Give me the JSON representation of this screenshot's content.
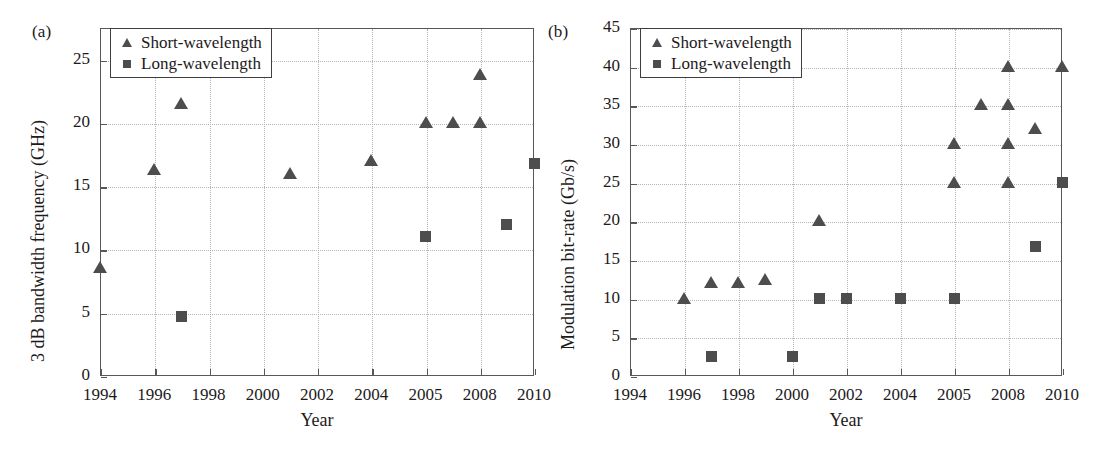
{
  "figure": {
    "panels": [
      {
        "tag": "(a)",
        "ylabel": "3 dB bandwidth frequency (GHz)",
        "xlabel": "Year",
        "yticks": [
          "0",
          "5",
          "10",
          "15",
          "20",
          "25"
        ],
        "xticks": [
          "1994",
          "1996",
          "1998",
          "2000",
          "2002",
          "2004",
          "2005",
          "2008",
          "2010"
        ],
        "legend": [
          {
            "label": "Short-wavelength",
            "marker": "triangle-marker"
          },
          {
            "label": "Long-wavelength",
            "marker": "square-marker"
          }
        ]
      },
      {
        "tag": "(b)",
        "ylabel": "Modulation bit-rate (Gb/s)",
        "xlabel": "Year",
        "yticks": [
          "0",
          "5",
          "10",
          "15",
          "20",
          "25",
          "30",
          "35",
          "40",
          "45"
        ],
        "xticks": [
          "1994",
          "1996",
          "1998",
          "2000",
          "2002",
          "2004",
          "2005",
          "2008",
          "2010"
        ],
        "legend": [
          {
            "label": "Short-wavelength",
            "marker": "triangle-marker"
          },
          {
            "label": "Long-wavelength",
            "marker": "square-marker"
          }
        ]
      }
    ],
    "marker_color": "#4d4d4d",
    "axis_color": "#57585a",
    "grid_color": "#b3b3b3"
  },
  "chart_data": [
    {
      "type": "scatter",
      "panel": "(a)",
      "title": "3 dB bandwidth frequency vs Year",
      "xlabel": "Year",
      "ylabel": "3 dB bandwidth frequency (GHz)",
      "xlim": [
        1994,
        2010
      ],
      "ylim": [
        0,
        27.5
      ],
      "yticks": [
        0,
        5,
        10,
        15,
        20,
        25
      ],
      "xticks": [
        1994,
        1996,
        1998,
        2000,
        2002,
        2004,
        2005,
        2008,
        2010
      ],
      "x_axis_type": "categorical-ticks",
      "grid": true,
      "legend_position": "top-left",
      "series": [
        {
          "name": "Short-wavelength",
          "marker": "triangle",
          "points": [
            {
              "x": 1994,
              "y": 8.5
            },
            {
              "x": 1996,
              "y": 16.3
            },
            {
              "x": 1997,
              "y": 21.5
            },
            {
              "x": 2001,
              "y": 16.0
            },
            {
              "x": 2004,
              "y": 17.0
            },
            {
              "x": 2005,
              "y": 20.0
            },
            {
              "x": 2006.5,
              "y": 20.0
            },
            {
              "x": 2008,
              "y": 20.0
            },
            {
              "x": 2008,
              "y": 23.8
            }
          ]
        },
        {
          "name": "Long-wavelength",
          "marker": "square",
          "points": [
            {
              "x": 1997,
              "y": 4.7
            },
            {
              "x": 2005,
              "y": 11.0
            },
            {
              "x": 2009,
              "y": 12.0
            },
            {
              "x": 2010,
              "y": 16.8
            }
          ]
        }
      ]
    },
    {
      "type": "scatter",
      "panel": "(b)",
      "title": "Modulation bit-rate vs Year",
      "xlabel": "Year",
      "ylabel": "Modulation bit-rate (Gb/s)",
      "xlim": [
        1994,
        2010
      ],
      "ylim": [
        0,
        45
      ],
      "yticks": [
        0,
        5,
        10,
        15,
        20,
        25,
        30,
        35,
        40,
        45
      ],
      "xticks": [
        1994,
        1996,
        1998,
        2000,
        2002,
        2004,
        2005,
        2008,
        2010
      ],
      "x_axis_type": "categorical-ticks",
      "grid": true,
      "legend_position": "top-left",
      "series": [
        {
          "name": "Short-wavelength",
          "marker": "triangle",
          "points": [
            {
              "x": 1996,
              "y": 10.0
            },
            {
              "x": 1997,
              "y": 12.0
            },
            {
              "x": 1998,
              "y": 12.0
            },
            {
              "x": 1999,
              "y": 12.4
            },
            {
              "x": 2001,
              "y": 20.0
            },
            {
              "x": 2005,
              "y": 30.0
            },
            {
              "x": 2005,
              "y": 25.0
            },
            {
              "x": 2006.5,
              "y": 35.0
            },
            {
              "x": 2008,
              "y": 40.0
            },
            {
              "x": 2008,
              "y": 35.0
            },
            {
              "x": 2008,
              "y": 30.0
            },
            {
              "x": 2008,
              "y": 25.0
            },
            {
              "x": 2009,
              "y": 32.0
            },
            {
              "x": 2010,
              "y": 40.0
            }
          ]
        },
        {
          "name": "Long-wavelength",
          "marker": "square",
          "points": [
            {
              "x": 1997,
              "y": 2.5
            },
            {
              "x": 2000,
              "y": 2.5
            },
            {
              "x": 2001,
              "y": 10.0
            },
            {
              "x": 2002,
              "y": 10.0
            },
            {
              "x": 2004,
              "y": 10.0
            },
            {
              "x": 2005,
              "y": 10.0
            },
            {
              "x": 2009,
              "y": 16.8
            },
            {
              "x": 2010,
              "y": 25.0
            }
          ]
        }
      ]
    }
  ]
}
